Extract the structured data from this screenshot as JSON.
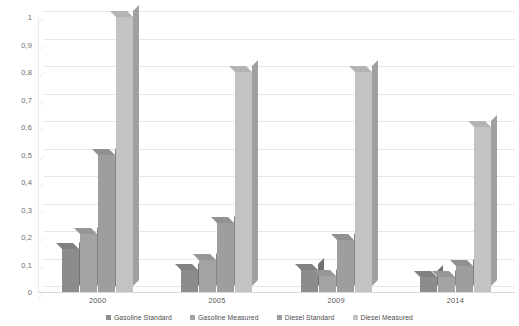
{
  "chart_data": {
    "type": "bar",
    "title": "",
    "subtitle": "",
    "xlabel": "",
    "ylabel": "",
    "categories": [
      "2000",
      "2005",
      "2009",
      "2014"
    ],
    "series": [
      {
        "name": "Gasoline Standard",
        "color": "#8c8c8c",
        "values": [
          0.155,
          0.08,
          0.08,
          0.055
        ]
      },
      {
        "name": "Gasoline Measured",
        "color": "#a3a3a3",
        "values": [
          0.21,
          0.115,
          0.06,
          0.055
        ]
      },
      {
        "name": "Diesel Standard",
        "color": "#9e9e9e",
        "values": [
          0.5,
          0.25,
          0.19,
          0.095
        ]
      },
      {
        "name": "Diesel Measured",
        "color": "#c3c3c3",
        "values": [
          1.0,
          0.8,
          0.8,
          0.6
        ]
      }
    ],
    "ylim": [
      0,
      1
    ],
    "ytick_step": 0.1,
    "ytick_labels": [
      "0",
      "0,1",
      "0,2",
      "0,3",
      "0,4",
      "0,5",
      "0,6",
      "0,7",
      "0,8",
      "0,9",
      "1"
    ],
    "grid": true,
    "legend_position": "bottom",
    "decimal_separator": ",",
    "style": "3d-column"
  },
  "legend": {
    "items": [
      {
        "label": "Gasoline Standard",
        "color": "#8c8c8c"
      },
      {
        "label": "Gasoline Measured",
        "color": "#a3a3a3"
      },
      {
        "label": "Diesel Standard",
        "color": "#9e9e9e"
      },
      {
        "label": "Diesel Measured",
        "color": "#c3c3c3"
      }
    ]
  },
  "colors": {
    "background": "#ffffff",
    "gridline": "#e8e8e8",
    "axis_text": "#6d6d6d"
  }
}
